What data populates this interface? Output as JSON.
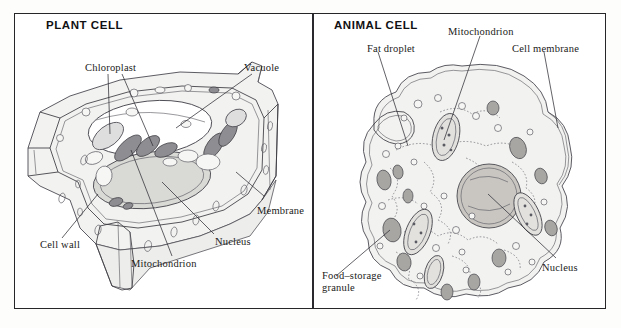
{
  "figure": {
    "width": 621,
    "height": 328,
    "background_color": "#ffffff",
    "frame_color": "#262629",
    "ink_color": "#3a3a40"
  },
  "panels": [
    {
      "id": "plant",
      "title": "PLANT CELL",
      "labels": [
        {
          "name": "chloroplast",
          "text": "Chloroplast"
        },
        {
          "name": "vacuole",
          "text": "Vacuole"
        },
        {
          "name": "membrane",
          "text": "Membrane"
        },
        {
          "name": "nucleus",
          "text": "Nucleus"
        },
        {
          "name": "mitochondrion",
          "text": "Mitochondrion"
        },
        {
          "name": "cell-wall",
          "text": "Cell wall"
        }
      ]
    },
    {
      "id": "animal",
      "title": "ANIMAL CELL",
      "labels": [
        {
          "name": "fat-droplet",
          "text": "Fat droplet"
        },
        {
          "name": "mitochondrion",
          "text": "Mitochondrion"
        },
        {
          "name": "cell-membrane",
          "text": "Cell membrane"
        },
        {
          "name": "food-storage-granule",
          "text": "Food–storage granule"
        },
        {
          "name": "nucleus",
          "text": "Nucleus"
        }
      ]
    }
  ]
}
